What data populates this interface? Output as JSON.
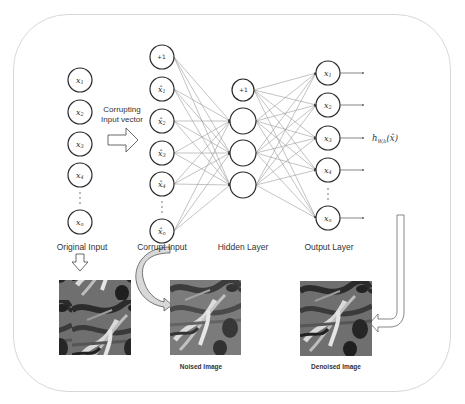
{
  "diagram": {
    "layers": {
      "original": {
        "label": "Original Input",
        "nodes": [
          "x1",
          "x2",
          "x3",
          "x4",
          "xn"
        ]
      },
      "corrupt": {
        "label": "Corrupt Input",
        "nodes": [
          "+1",
          "x̂1",
          "x̂2",
          "x̂3",
          "x̂4",
          "x̂n"
        ]
      },
      "hidden": {
        "label": "Hidden Layer",
        "nodes": [
          "+1",
          "",
          "",
          ""
        ]
      },
      "output": {
        "label": "Output Layer",
        "nodes": [
          "x1",
          "x2",
          "x3",
          "x4",
          "xn"
        ]
      }
    },
    "corrupting_label_line1": "Corrupting",
    "corrupting_label_line2": "Input vector",
    "output_function": "hW,b(x̂)",
    "images": {
      "original": {
        "caption": ""
      },
      "noised": {
        "caption": "Noised Image"
      },
      "denoised": {
        "caption": "Denoised Image"
      }
    },
    "colors": {
      "node_stroke": "#2a2a2a",
      "edge": "#9a9a9a",
      "frame": "#d8d8d8",
      "text": "#333333"
    }
  }
}
